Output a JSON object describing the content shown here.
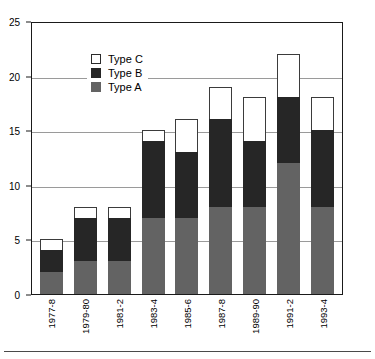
{
  "chart_data": {
    "type": "bar",
    "subtype": "stacked-bar",
    "title": "",
    "xlabel": "",
    "ylabel": "",
    "ylim": [
      0,
      25
    ],
    "yticks": [
      0,
      5,
      10,
      15,
      20,
      25
    ],
    "grid": true,
    "legend_position": "top-left inside plot area",
    "categories": [
      "1977-8",
      "1979-80",
      "1981-2",
      "1983-4",
      "1985-6",
      "1987-8",
      "1989-90",
      "1991-2",
      "1993-4"
    ],
    "series": [
      {
        "name": "Type A",
        "color": "#636363",
        "values": [
          2,
          3,
          3,
          7,
          7,
          8,
          8,
          12,
          8
        ]
      },
      {
        "name": "Type B",
        "color": "#262626",
        "values": [
          2,
          4,
          4,
          7,
          6,
          8,
          6,
          6,
          7
        ]
      },
      {
        "name": "Type C",
        "color": "#ffffff",
        "values": [
          1,
          1,
          1,
          1,
          3,
          3,
          4,
          4,
          3
        ]
      }
    ],
    "totals": [
      5,
      8,
      8,
      15,
      16,
      19,
      18,
      22,
      18
    ]
  },
  "legend": {
    "items": [
      {
        "label": "Type C",
        "swatch": "legend-swatch-type-c"
      },
      {
        "label": "Type B",
        "swatch": "legend-swatch-type-b"
      },
      {
        "label": "Type A",
        "swatch": "legend-swatch-type-a"
      }
    ]
  },
  "axes": {
    "y_tick_labels": [
      "25",
      "20",
      "15",
      "10",
      "5",
      "0"
    ],
    "x_tick_labels": [
      "1977-8",
      "1979-80",
      "1981-2",
      "1983-4",
      "1985-6",
      "1987-8",
      "1989-90",
      "1991-2",
      "1993-4"
    ]
  }
}
